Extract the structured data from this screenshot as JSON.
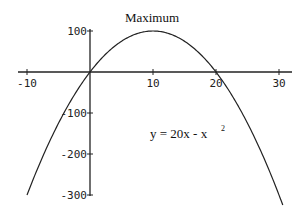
{
  "chart_data": {
    "type": "line",
    "title": "Maximum",
    "annotation": "y = 20x - x 2",
    "equation": {
      "base": "y = 20x - x",
      "exponent": "2"
    },
    "xlabel": "",
    "ylabel": "",
    "xlim": [
      -10,
      30
    ],
    "ylim": [
      -300,
      100
    ],
    "x_ticks": [
      -10,
      10,
      20,
      30
    ],
    "y_ticks": [
      100,
      -100,
      -200,
      -300
    ],
    "x_tick_labels": [
      "-10",
      "10",
      "20",
      "30"
    ],
    "y_tick_labels": [
      "100",
      "-100",
      "-200",
      "-300"
    ],
    "grid": false,
    "legend": null,
    "series": [
      {
        "name": "y = 20x - x^2",
        "x": [
          -10,
          -5,
          0,
          5,
          10,
          15,
          20,
          25,
          30
        ],
        "values": [
          -300,
          -125,
          0,
          75,
          100,
          75,
          0,
          -125,
          -300
        ]
      }
    ],
    "key_points": {
      "maximum": {
        "x": 10,
        "y": 100
      },
      "roots": [
        0,
        20
      ]
    }
  },
  "colors": {
    "line": "#222222",
    "axis": "#222222",
    "background": "#ffffff"
  }
}
